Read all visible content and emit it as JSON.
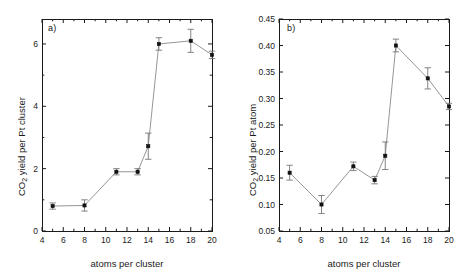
{
  "figure": {
    "background": "#ffffff",
    "ink": "#1a1a1a",
    "marker_color": "#111111",
    "line_color": "#8a8a8a"
  },
  "chart_data": [
    {
      "type": "line",
      "panel_label": "a)",
      "title": "",
      "xlabel": "atoms per cluster",
      "ylabel_prefix": "CO",
      "ylabel_sub": "2",
      "ylabel_suffix": " yield per Pt cluster",
      "ylabel": "CO2 yield per Pt cluster",
      "xlim": [
        4,
        20
      ],
      "ylim": [
        0,
        6.8
      ],
      "xticks": [
        4,
        6,
        8,
        10,
        12,
        14,
        16,
        18,
        20
      ],
      "xticklabels": [
        "4",
        "6",
        "8",
        "10",
        "12",
        "14",
        "16",
        "18",
        "20"
      ],
      "xminor_step": 1,
      "yticks": [
        0,
        2,
        4,
        6
      ],
      "yticklabels": [
        "0",
        "2",
        "4",
        "6"
      ],
      "yminor": [
        1,
        3,
        5
      ],
      "grid": false,
      "legend": "none",
      "x": [
        5,
        8,
        11,
        13,
        14,
        15,
        18,
        20
      ],
      "values": [
        0.8,
        0.82,
        1.9,
        1.9,
        2.72,
        6.0,
        6.1,
        5.65
      ],
      "yerr": [
        0.1,
        0.18,
        0.1,
        0.1,
        0.42,
        0.2,
        0.37,
        0.12
      ]
    },
    {
      "type": "line",
      "panel_label": "b)",
      "title": "",
      "xlabel": "atoms per cluster",
      "ylabel_prefix": "CO",
      "ylabel_sub": "2",
      "ylabel_suffix": " yield per Pt atom",
      "ylabel": "CO2 yield per Pt atom",
      "xlim": [
        4,
        20
      ],
      "ylim": [
        0.05,
        0.45
      ],
      "xticks": [
        4,
        6,
        8,
        10,
        12,
        14,
        16,
        18,
        20
      ],
      "xticklabels": [
        "4",
        "6",
        "8",
        "10",
        "12",
        "14",
        "16",
        "18",
        "20"
      ],
      "xminor_step": 1,
      "yticks": [
        0.05,
        0.1,
        0.15,
        0.2,
        0.25,
        0.3,
        0.35,
        0.4,
        0.45
      ],
      "yticklabels": [
        "0.05",
        "0.10",
        "0.15",
        "0.20",
        "0.25",
        "0.30",
        "0.35",
        "0.40",
        "0.45"
      ],
      "yminor": [],
      "grid": false,
      "legend": "none",
      "x": [
        5,
        8,
        11,
        13,
        14,
        15,
        18,
        20
      ],
      "values": [
        0.16,
        0.1,
        0.172,
        0.146,
        0.192,
        0.4,
        0.338,
        0.285
      ],
      "yerr": [
        0.014,
        0.017,
        0.008,
        0.007,
        0.026,
        0.012,
        0.02,
        0.006
      ]
    }
  ]
}
